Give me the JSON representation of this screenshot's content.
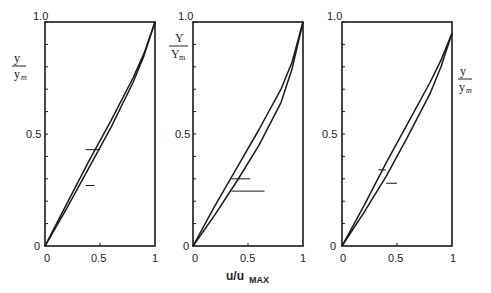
{
  "chart_data": [
    {
      "type": "line",
      "panel": 1,
      "ylabel": "y/y_m",
      "xlabel": "",
      "xlim": [
        0,
        1
      ],
      "ylim": [
        0,
        1.0
      ],
      "x_ticks": [
        "0",
        "0.5",
        "1"
      ],
      "y_ticks": [
        "0",
        "0.5",
        "1.0"
      ],
      "series": [
        {
          "name": "upper curve",
          "x": [
            0,
            0.2,
            0.4,
            0.6,
            0.8,
            0.9,
            1.0
          ],
          "y": [
            0,
            0.19,
            0.38,
            0.56,
            0.75,
            0.86,
            1.0
          ]
        },
        {
          "name": "lower curve",
          "x": [
            0,
            0.2,
            0.4,
            0.6,
            0.8,
            0.9,
            1.0
          ],
          "y": [
            0,
            0.17,
            0.35,
            0.53,
            0.73,
            0.85,
            1.0
          ]
        }
      ],
      "annotations": [
        {
          "type": "hline-marker",
          "x0": 0.37,
          "x1": 0.5,
          "y": 0.43
        },
        {
          "type": "hline-marker",
          "x0": 0.37,
          "x1": 0.45,
          "y": 0.27
        }
      ]
    },
    {
      "type": "line",
      "panel": 2,
      "ylabel": "Y/Y_m",
      "xlabel": "u/u_MAX",
      "xlim": [
        0,
        1
      ],
      "ylim": [
        0,
        1.0
      ],
      "x_ticks": [
        "0",
        "0.5",
        "1"
      ],
      "y_ticks": [
        "0",
        "0.5",
        "1.0"
      ],
      "series": [
        {
          "name": "upper curve",
          "x": [
            0,
            0.2,
            0.4,
            0.6,
            0.8,
            0.9,
            1.0
          ],
          "y": [
            0,
            0.18,
            0.35,
            0.52,
            0.7,
            0.82,
            1.0
          ]
        },
        {
          "name": "lower curve",
          "x": [
            0,
            0.2,
            0.4,
            0.6,
            0.8,
            0.9,
            1.0
          ],
          "y": [
            0,
            0.14,
            0.29,
            0.45,
            0.64,
            0.79,
            1.0
          ]
        }
      ],
      "annotations": [
        {
          "type": "hline-marker",
          "x0": 0.35,
          "x1": 0.52,
          "y": 0.3
        },
        {
          "type": "hline-marker",
          "x0": 0.35,
          "x1": 0.65,
          "y": 0.245
        }
      ]
    },
    {
      "type": "line",
      "panel": 3,
      "ylabel": "y/y_m",
      "ylabel_position": "right",
      "xlabel": "",
      "xlim": [
        0,
        1
      ],
      "ylim": [
        0,
        1.0
      ],
      "x_ticks": [
        "0",
        "0.5",
        "1"
      ],
      "y_ticks": [
        "0",
        "0.5",
        "1.0"
      ],
      "series": [
        {
          "name": "upper curve",
          "x": [
            0,
            0.2,
            0.4,
            0.6,
            0.8,
            0.9,
            1.0
          ],
          "y": [
            0,
            0.18,
            0.37,
            0.55,
            0.73,
            0.83,
            0.95
          ]
        },
        {
          "name": "lower curve",
          "x": [
            0,
            0.2,
            0.4,
            0.6,
            0.8,
            0.9,
            1.0
          ],
          "y": [
            0,
            0.15,
            0.31,
            0.49,
            0.68,
            0.8,
            0.95
          ]
        }
      ],
      "annotations": [
        {
          "type": "hline-marker",
          "x0": 0.33,
          "x1": 0.4,
          "y": 0.34
        },
        {
          "type": "hline-marker",
          "x0": 0.4,
          "x1": 0.5,
          "y": 0.28
        }
      ]
    }
  ],
  "labels": {
    "panel1_ylabel_num": "y",
    "panel1_ylabel_den": "y",
    "panel1_ylabel_sub": "m",
    "panel2_ylabel_num": "Y",
    "panel2_ylabel_den": "Y",
    "panel2_ylabel_sub": "m",
    "panel3_ylabel_num": "y",
    "panel3_ylabel_den": "y",
    "panel3_ylabel_sub": "m",
    "xlabel_main": "u/u",
    "xlabel_sub": "MAX",
    "tick_0": "0",
    "tick_half": "0.5",
    "tick_1": "1",
    "tick_top": "1.0"
  }
}
